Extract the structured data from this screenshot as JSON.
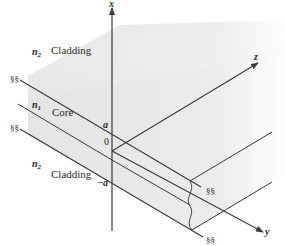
{
  "figure": {
    "type": "planar-waveguide-diagram",
    "colors": {
      "line": "#3a3a3a",
      "shade": "#e6e6e6",
      "background": "#ffffff"
    },
    "axes": {
      "x": {
        "label": "x"
      },
      "y": {
        "label": "y"
      },
      "z": {
        "label": "z"
      }
    },
    "ticks": {
      "top": "a",
      "origin": "0",
      "bottom": "−a"
    },
    "regions": [
      {
        "name": "upper-cladding",
        "index_symbol": "n",
        "index_sub": "2",
        "label": "Cladding"
      },
      {
        "name": "core",
        "index_symbol": "n",
        "index_sub": "1",
        "label": "Core"
      },
      {
        "name": "lower-cladding",
        "index_symbol": "n",
        "index_sub": "2",
        "label": "Cladding"
      }
    ],
    "break_symbol": "§§"
  }
}
